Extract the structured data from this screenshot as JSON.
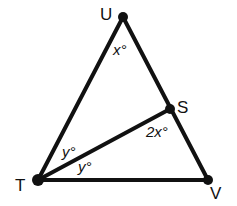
{
  "figure": {
    "type": "geometry-diagram",
    "vertices": [
      {
        "id": "U",
        "label": "U"
      },
      {
        "id": "S",
        "label": "S"
      },
      {
        "id": "T",
        "label": "T"
      },
      {
        "id": "V",
        "label": "V"
      }
    ],
    "segments": [
      {
        "id": "TU",
        "from": "T",
        "to": "U"
      },
      {
        "id": "UV",
        "from": "U",
        "to": "V"
      },
      {
        "id": "TV",
        "from": "T",
        "to": "V"
      },
      {
        "id": "TS",
        "from": "T",
        "to": "S"
      }
    ],
    "angle_labels": [
      {
        "id": "angle-u",
        "text": "x°",
        "at": "U"
      },
      {
        "id": "angle-s",
        "text": "2x°",
        "at": "S"
      },
      {
        "id": "angle-t-upper",
        "text": "y°",
        "at": "T"
      },
      {
        "id": "angle-t-lower",
        "text": "y°",
        "at": "T"
      }
    ],
    "stroke_color": "#111111",
    "background_color": "#ffffff"
  }
}
